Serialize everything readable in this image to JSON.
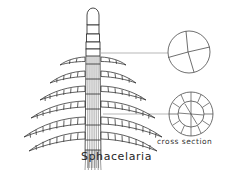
{
  "figure": {
    "kind": "botanical-line-drawing",
    "background": "#ffffff",
    "ink": "#2b2b2b",
    "leader_color": "#9a9a9a",
    "species_label": "Sphacelaria",
    "cross_section_label": "cross section",
    "insets": [
      {
        "name": "apical-cell-division-inset",
        "cx": 189,
        "cy": 52,
        "r": 21,
        "sectors": 4,
        "leader_from_x": 100,
        "leader_from_y": 53
      },
      {
        "name": "cross-section-inset",
        "cx": 191,
        "cy": 114,
        "r": 22,
        "cortical_cells": 12,
        "inner_r": 13,
        "leader_from_x": 100,
        "leader_from_y": 114
      }
    ],
    "thallus": {
      "apex_x": 93,
      "apex_top_y": 8,
      "axis_bottom_y": 160,
      "axis_half_width": 6,
      "axis_striations": 7,
      "apical_cell_height": 17,
      "segment_count": 5,
      "whorls": [
        {
          "y": 58,
          "length": 30,
          "droop": 9,
          "cells": 5
        },
        {
          "y": 72,
          "length": 42,
          "droop": 13,
          "cells": 7
        },
        {
          "y": 87,
          "length": 54,
          "droop": 16,
          "cells": 9
        },
        {
          "y": 102,
          "length": 66,
          "droop": 19,
          "cells": 11
        },
        {
          "y": 118,
          "length": 74,
          "droop": 21,
          "cells": 12
        },
        {
          "y": 133,
          "length": 70,
          "droop": 19,
          "cells": 11
        }
      ]
    }
  }
}
